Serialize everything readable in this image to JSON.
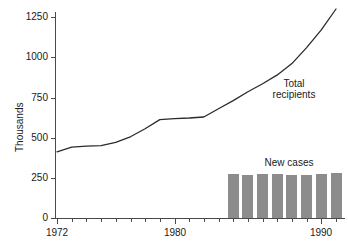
{
  "chart_data": {
    "type": "line",
    "title": "",
    "subtitle": "",
    "xlabel": "",
    "ylabel": "Thousands",
    "xlim": [
      1971.6,
      1991.6
    ],
    "ylim": [
      0,
      1320
    ],
    "grid": false,
    "legend_position": "inline-annotations",
    "y_ticks": [
      0,
      250,
      500,
      750,
      1000,
      1250
    ],
    "y_tick_labels": [
      "0",
      "250",
      "500",
      "750",
      "1000",
      "1250"
    ],
    "x_ticks": [
      1972,
      1973,
      1974,
      1975,
      1976,
      1977,
      1978,
      1979,
      1980,
      1981,
      1982,
      1983,
      1984,
      1985,
      1986,
      1987,
      1988,
      1989,
      1990,
      1991
    ],
    "x_tick_labels_shown": [
      {
        "value": 1972,
        "label": "1972"
      },
      {
        "value": 1980,
        "label": "1980"
      },
      {
        "value": 1990,
        "label": "1990"
      }
    ],
    "annotations": [
      {
        "name": "total-recipients-label",
        "text": "Total\nrecipients",
        "line1": "Total",
        "line2": "recipients",
        "x": 1986.0,
        "y": 840
      },
      {
        "name": "new-cases-label",
        "text": "New cases",
        "line1": "New cases",
        "x": 1985.6,
        "y": 380
      }
    ],
    "series": [
      {
        "name": "Total recipients",
        "type": "line",
        "color": "#2b2b2b",
        "x": [
          1972,
          1973,
          1974,
          1975,
          1976,
          1977,
          1978,
          1979,
          1980,
          1981,
          1982,
          1983,
          1984,
          1985,
          1986,
          1987,
          1988,
          1989,
          1990,
          1991
        ],
        "values": [
          412,
          440,
          447,
          450,
          470,
          505,
          555,
          612,
          618,
          622,
          628,
          680,
          730,
          785,
          835,
          890,
          960,
          1060,
          1170,
          1300
        ]
      },
      {
        "name": "New cases",
        "type": "bar",
        "color": "#8c8c8c",
        "x": [
          1984,
          1985,
          1986,
          1987,
          1988,
          1989,
          1990,
          1991
        ],
        "values": [
          272,
          265,
          273,
          275,
          270,
          270,
          275,
          282
        ]
      }
    ]
  },
  "axis": {
    "y_title": "Thousands",
    "y_labels": [
      "1250",
      "1000",
      "750",
      "500",
      "250",
      "0"
    ],
    "x_labels": [
      "1972",
      "1980",
      "1990"
    ]
  },
  "labels": {
    "total_recipients_line1": "Total",
    "total_recipients_line2": "recipients",
    "new_cases": "New cases"
  },
  "colors": {
    "axis": "#4a4a4a",
    "line": "#2b2b2b",
    "bar": "#8c8c8c",
    "text": "#1a1a1a",
    "background": "#ffffff"
  }
}
